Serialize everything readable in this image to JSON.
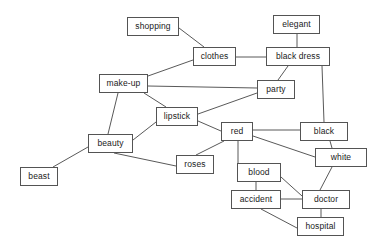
{
  "diagram": {
    "type": "undirected-graph",
    "width": 378,
    "height": 247,
    "background_color": "#ffffff",
    "node_border_color": "#545454",
    "node_fill_color": "#ffffff",
    "node_text_color": "#1a1a1a",
    "edge_color": "#595959",
    "nodes": [
      {
        "id": "shopping",
        "label": "shopping",
        "x": 127,
        "y": 17,
        "w": 52,
        "h": 19
      },
      {
        "id": "elegant",
        "label": "elegant",
        "x": 273,
        "y": 15,
        "w": 47,
        "h": 19
      },
      {
        "id": "clothes",
        "label": "clothes",
        "x": 193,
        "y": 47,
        "w": 43,
        "h": 19
      },
      {
        "id": "black_dress",
        "label": "black dress",
        "x": 266,
        "y": 47,
        "w": 64,
        "h": 19
      },
      {
        "id": "make_up",
        "label": "make-up",
        "x": 99,
        "y": 74,
        "w": 49,
        "h": 19
      },
      {
        "id": "party",
        "label": "party",
        "x": 257,
        "y": 80,
        "w": 38,
        "h": 19
      },
      {
        "id": "lipstick",
        "label": "lipstick",
        "x": 156,
        "y": 107,
        "w": 42,
        "h": 19
      },
      {
        "id": "red",
        "label": "red",
        "x": 221,
        "y": 122,
        "w": 32,
        "h": 19
      },
      {
        "id": "black",
        "label": "black",
        "x": 300,
        "y": 122,
        "w": 48,
        "h": 19
      },
      {
        "id": "white",
        "label": "white",
        "x": 315,
        "y": 148,
        "w": 52,
        "h": 19
      },
      {
        "id": "beauty",
        "label": "beauty",
        "x": 88,
        "y": 134,
        "w": 45,
        "h": 19
      },
      {
        "id": "roses",
        "label": "roses",
        "x": 176,
        "y": 155,
        "w": 38,
        "h": 19
      },
      {
        "id": "blood",
        "label": "blood",
        "x": 237,
        "y": 163,
        "w": 44,
        "h": 19
      },
      {
        "id": "beast",
        "label": "beast",
        "x": 20,
        "y": 167,
        "w": 38,
        "h": 19
      },
      {
        "id": "accident",
        "label": "accident",
        "x": 231,
        "y": 190,
        "w": 50,
        "h": 19
      },
      {
        "id": "doctor",
        "label": "doctor",
        "x": 302,
        "y": 190,
        "w": 48,
        "h": 19
      },
      {
        "id": "hospital",
        "label": "hospital",
        "x": 297,
        "y": 217,
        "w": 47,
        "h": 19
      }
    ],
    "edges": [
      {
        "from": "shopping",
        "to": "clothes",
        "x1": 179,
        "y1": 28,
        "x2": 204,
        "y2": 47
      },
      {
        "from": "elegant",
        "to": "black_dress",
        "x1": 297,
        "y1": 34,
        "x2": 297,
        "y2": 47
      },
      {
        "from": "clothes",
        "to": "black_dress",
        "x1": 236,
        "y1": 57,
        "x2": 266,
        "y2": 57
      },
      {
        "from": "clothes",
        "to": "make_up",
        "x1": 193,
        "y1": 60,
        "x2": 148,
        "y2": 76
      },
      {
        "from": "black_dress",
        "to": "party",
        "x1": 288,
        "y1": 66,
        "x2": 278,
        "y2": 80
      },
      {
        "from": "black_dress",
        "to": "black",
        "x1": 322,
        "y1": 66,
        "x2": 324,
        "y2": 122
      },
      {
        "from": "make_up",
        "to": "party",
        "x1": 148,
        "y1": 86,
        "x2": 257,
        "y2": 88
      },
      {
        "from": "make_up",
        "to": "lipstick",
        "x1": 144,
        "y1": 93,
        "x2": 166,
        "y2": 107
      },
      {
        "from": "make_up",
        "to": "beauty",
        "x1": 118,
        "y1": 93,
        "x2": 108,
        "y2": 134
      },
      {
        "from": "party",
        "to": "lipstick",
        "x1": 257,
        "y1": 93,
        "x2": 198,
        "y2": 114
      },
      {
        "from": "lipstick",
        "to": "red",
        "x1": 198,
        "y1": 121,
        "x2": 221,
        "y2": 131
      },
      {
        "from": "lipstick",
        "to": "beauty",
        "x1": 156,
        "y1": 122,
        "x2": 133,
        "y2": 140
      },
      {
        "from": "red",
        "to": "black",
        "x1": 253,
        "y1": 130,
        "x2": 300,
        "y2": 130
      },
      {
        "from": "red",
        "to": "white",
        "x1": 253,
        "y1": 136,
        "x2": 315,
        "y2": 157
      },
      {
        "from": "red",
        "to": "roses",
        "x1": 224,
        "y1": 141,
        "x2": 196,
        "y2": 155
      },
      {
        "from": "red",
        "to": "blood",
        "x1": 238,
        "y1": 141,
        "x2": 238,
        "y2": 163
      },
      {
        "from": "black",
        "to": "white",
        "x1": 330,
        "y1": 141,
        "x2": 332,
        "y2": 148
      },
      {
        "from": "white",
        "to": "doctor",
        "x1": 332,
        "y1": 167,
        "x2": 320,
        "y2": 190
      },
      {
        "from": "beauty",
        "to": "beast",
        "x1": 88,
        "y1": 147,
        "x2": 53,
        "y2": 167
      },
      {
        "from": "beauty",
        "to": "roses",
        "x1": 114,
        "y1": 153,
        "x2": 176,
        "y2": 166
      },
      {
        "from": "blood",
        "to": "accident",
        "x1": 256,
        "y1": 182,
        "x2": 256,
        "y2": 190
      },
      {
        "from": "blood",
        "to": "doctor",
        "x1": 281,
        "y1": 177,
        "x2": 302,
        "y2": 196
      },
      {
        "from": "accident",
        "to": "doctor",
        "x1": 281,
        "y1": 199,
        "x2": 302,
        "y2": 199
      },
      {
        "from": "accident",
        "to": "hospital",
        "x1": 261,
        "y1": 209,
        "x2": 297,
        "y2": 228
      },
      {
        "from": "doctor",
        "to": "hospital",
        "x1": 321,
        "y1": 209,
        "x2": 321,
        "y2": 217
      }
    ]
  }
}
